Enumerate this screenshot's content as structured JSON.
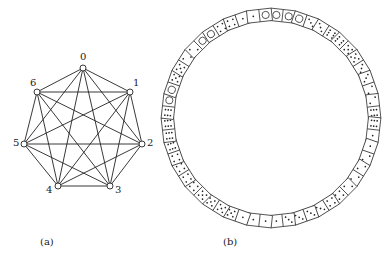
{
  "figure": {
    "panel_a": {
      "caption": "(a)",
      "nodes": [
        {
          "id": "0",
          "label": "0",
          "x": 83,
          "y": 68,
          "lx": 80,
          "ly": 60
        },
        {
          "id": "1",
          "label": "1",
          "x": 130,
          "y": 92,
          "lx": 133,
          "ly": 86
        },
        {
          "id": "2",
          "label": "2",
          "x": 142,
          "y": 144,
          "lx": 147,
          "ly": 146
        },
        {
          "id": "3",
          "label": "3",
          "x": 110,
          "y": 186,
          "lx": 115,
          "ly": 193
        },
        {
          "id": "4",
          "label": "4",
          "x": 58,
          "y": 186,
          "lx": 46,
          "ly": 193
        },
        {
          "id": "5",
          "label": "5",
          "x": 24,
          "y": 144,
          "lx": 13,
          "ly": 146
        },
        {
          "id": "6",
          "label": "6",
          "x": 37,
          "y": 92,
          "lx": 30,
          "ly": 86
        }
      ],
      "graph": "complete graph K7"
    },
    "panel_b": {
      "caption": "(b)",
      "center": [
        271,
        118
      ],
      "radius": 103,
      "dominoes": [
        [
          0,
          0
        ],
        [
          0,
          3
        ],
        [
          3,
          6
        ],
        [
          6,
          5
        ],
        [
          5,
          3
        ],
        [
          3,
          2
        ],
        [
          2,
          6
        ],
        [
          6,
          1
        ],
        [
          1,
          2
        ],
        [
          2,
          2
        ],
        [
          2,
          4
        ],
        [
          4,
          3
        ],
        [
          3,
          3
        ],
        [
          3,
          1
        ],
        [
          1,
          1
        ],
        [
          1,
          5
        ],
        [
          5,
          5
        ],
        [
          5,
          4
        ],
        [
          4,
          4
        ],
        [
          4,
          6
        ],
        [
          6,
          6
        ],
        [
          6,
          0
        ],
        [
          0,
          5
        ],
        [
          5,
          2
        ],
        [
          2,
          0
        ],
        [
          0,
          4
        ],
        [
          4,
          1
        ],
        [
          1,
          0
        ]
      ]
    }
  }
}
